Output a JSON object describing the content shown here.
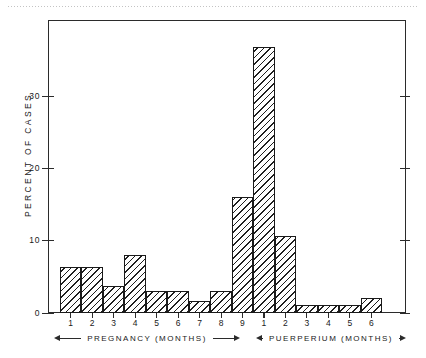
{
  "figure": {
    "background": "#ffffff",
    "ink": "#1a1a1a"
  },
  "axes": {
    "y_title": "PERCENT  OF  CASES",
    "y_ticks": [
      "0",
      "10",
      "20",
      "30"
    ],
    "x_groups": [
      {
        "label": "PREGNANCY   (MONTHS)",
        "ticks": [
          "1",
          "2",
          "3",
          "4",
          "5",
          "6",
          "7",
          "8",
          "9"
        ]
      },
      {
        "label": "PUERPERIUM  (MONTHS)",
        "ticks": [
          "1",
          "2",
          "3",
          "4",
          "5",
          "6"
        ]
      }
    ]
  },
  "chart_data": {
    "type": "bar",
    "title": "",
    "subtitle": "",
    "xlabel": "PREGNANCY (MONTHS) / PUERPERIUM (MONTHS)",
    "ylabel": "PERCENT OF CASES",
    "ylim": [
      0,
      38
    ],
    "yticks": [
      0,
      10,
      20,
      30
    ],
    "grid": false,
    "legend": "none",
    "categories": [
      "Pregnancy 1",
      "Pregnancy 2",
      "Pregnancy 3",
      "Pregnancy 4",
      "Pregnancy 5",
      "Pregnancy 6",
      "Pregnancy 7",
      "Pregnancy 8",
      "Pregnancy 9",
      "Puerperium 1",
      "Puerperium 2",
      "Puerperium 3",
      "Puerperium 4",
      "Puerperium 5",
      "Puerperium 6"
    ],
    "tick_labels": [
      "1",
      "2",
      "3",
      "4",
      "5",
      "6",
      "7",
      "8",
      "9",
      "1",
      "2",
      "3",
      "4",
      "5",
      "6"
    ],
    "values": [
      6,
      6,
      3.5,
      7.5,
      2.8,
      2.8,
      1.5,
      2.8,
      15,
      34.5,
      10,
      1,
      1,
      1,
      2
    ],
    "bar_style": "diagonal-hatch",
    "annotations": [
      "Arrow-bounded group label: PREGNANCY (MONTHS) spanning months 1-9",
      "Arrow-bounded group label: PUERPERIUM (MONTHS) spanning months 1-6"
    ]
  }
}
